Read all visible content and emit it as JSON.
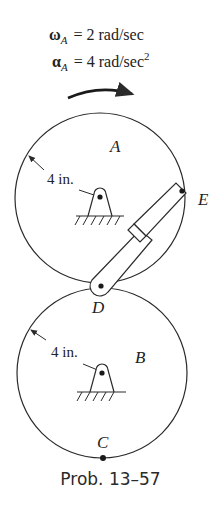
{
  "given": {
    "omega_symbol": "ω",
    "omega_sub": "A",
    "omega_value": "= 2 rad/sec",
    "alpha_symbol": "α",
    "alpha_sub": "A",
    "alpha_value": "= 4 rad/sec",
    "alpha_exp": "2"
  },
  "gear_a": {
    "label": "A",
    "radius_label": "4 in."
  },
  "gear_b": {
    "label": "B",
    "radius_label": "4 in."
  },
  "points": {
    "d": "D",
    "e": "E",
    "c": "C"
  },
  "caption": "Prob. 13–57",
  "colors": {
    "line": "#2a2a2a",
    "background": "#ffffff"
  }
}
